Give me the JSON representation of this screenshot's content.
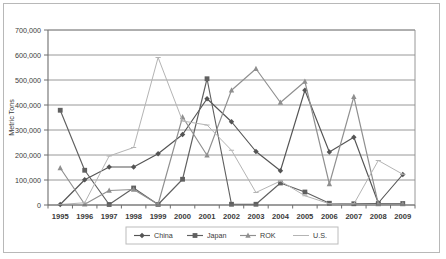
{
  "chart_data": {
    "type": "line",
    "title": "",
    "xlabel": "",
    "ylabel": "Metric Tons",
    "x": [
      1995,
      1996,
      1997,
      1998,
      1999,
      2000,
      2001,
      2002,
      2003,
      2004,
      2005,
      2006,
      2007,
      2008,
      2009
    ],
    "categories": [
      "1995",
      "1996",
      "1997",
      "1998",
      "1999",
      "2000",
      "2001",
      "2002",
      "2003",
      "2004",
      "2005",
      "2006",
      "2007",
      "2008",
      "2009"
    ],
    "ylim": [
      0,
      700000
    ],
    "ytick_values": [
      0,
      100000,
      200000,
      300000,
      400000,
      500000,
      600000,
      700000
    ],
    "ytick_labels": [
      "0",
      "100,000",
      "200,000",
      "300,000",
      "400,000",
      "500,000",
      "600,000",
      "700,000"
    ],
    "grid": true,
    "legend_position": "bottom",
    "series": [
      {
        "name": "China",
        "color": "#545454",
        "marker": "diamond",
        "values": [
          2000,
          101000,
          152000,
          152000,
          205000,
          282000,
          425000,
          333000,
          214000,
          137000,
          459000,
          212000,
          271000,
          8000,
          122000
        ]
      },
      {
        "name": "Japan",
        "color": "#606060",
        "marker": "square",
        "values": [
          379000,
          139000,
          2000,
          68000,
          2000,
          103000,
          505000,
          3000,
          3000,
          88000,
          52000,
          7000,
          5000,
          6000,
          6000
        ]
      },
      {
        "name": "ROK",
        "color": "#8f8f8f",
        "marker": "triangle",
        "values": [
          148000,
          3000,
          58000,
          62000,
          3000,
          352000,
          199000,
          459000,
          545000,
          410000,
          494000,
          84000,
          433000,
          4000,
          4000
        ]
      },
      {
        "name": "U.S.",
        "color": "#b4b4b4",
        "marker": "line",
        "values": [
          2000,
          9000,
          196000,
          230000,
          590000,
          336000,
          320000,
          219000,
          50000,
          96000,
          37000,
          5000,
          4000,
          178000,
          123000
        ]
      }
    ]
  },
  "legend": {
    "items": [
      {
        "label": "China"
      },
      {
        "label": "Japan"
      },
      {
        "label": "ROK"
      },
      {
        "label": "U.S."
      }
    ]
  },
  "axes": {
    "y_title": "Metric Tons"
  }
}
